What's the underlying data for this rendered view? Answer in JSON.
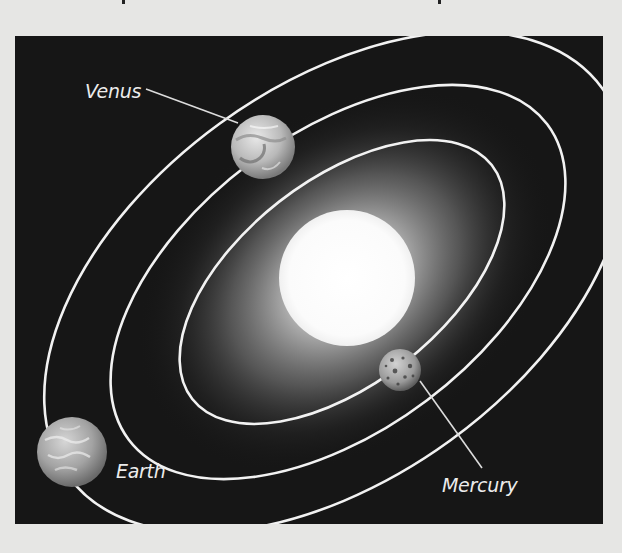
{
  "figure": {
    "colors": {
      "page_background": "#e6e6e4",
      "space_background": "#161616",
      "orbit_line": "#f2f2f2",
      "sun": "#ffffff",
      "label_text": "#ececec"
    },
    "sun": {
      "label": ""
    },
    "planets": [
      {
        "name": "Venus",
        "label": "Venus",
        "orbit": "middle"
      },
      {
        "name": "Earth",
        "label": "Earth",
        "orbit": "outer"
      },
      {
        "name": "Mercury",
        "label": "Mercury",
        "orbit": "inner"
      }
    ]
  }
}
